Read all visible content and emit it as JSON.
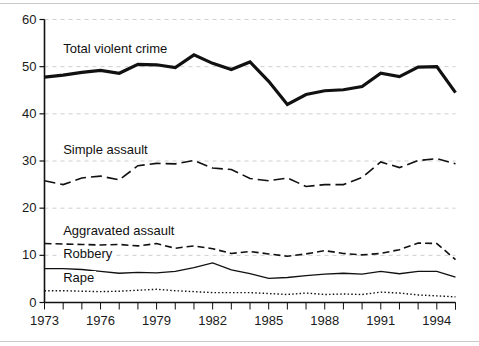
{
  "chart_data": {
    "type": "line",
    "title": "",
    "subtitle": "",
    "xlabel": "",
    "ylabel": "",
    "xlim": [
      1973,
      1995
    ],
    "ylim": [
      0,
      60
    ],
    "grid": true,
    "legend_position": "inline-labels",
    "x": [
      1973,
      1974,
      1975,
      1976,
      1977,
      1978,
      1979,
      1980,
      1981,
      1982,
      1983,
      1984,
      1985,
      1986,
      1987,
      1988,
      1989,
      1990,
      1991,
      1992,
      1993,
      1994,
      1995
    ],
    "xticks": [
      1973,
      1976,
      1979,
      1982,
      1985,
      1988,
      1991,
      1994
    ],
    "xtick_labels": [
      "1973",
      "1976",
      "1979",
      "1982",
      "1985",
      "1988",
      "1991",
      "1994"
    ],
    "yticks": [
      0,
      10,
      20,
      30,
      40,
      50,
      60
    ],
    "ytick_labels": [
      "0",
      "10",
      "20",
      "30",
      "40",
      "50",
      "60"
    ],
    "series": [
      {
        "name": "Total violent crime",
        "style": "solid-thick",
        "color": "#111111",
        "label_x": 1974.0,
        "label_y": 53.8,
        "values": [
          47.8,
          48.2,
          48.8,
          49.2,
          48.6,
          50.5,
          50.4,
          49.8,
          52.5,
          50.7,
          49.4,
          51.0,
          46.9,
          42.0,
          44.1,
          44.9,
          45.1,
          45.8,
          48.6,
          47.9,
          49.9,
          50.0,
          44.5
        ]
      },
      {
        "name": "Simple assault",
        "style": "dash-long",
        "color": "#111111",
        "label_x": 1974.0,
        "label_y": 32.3,
        "values": [
          25.8,
          25.0,
          26.4,
          26.8,
          26.0,
          29.0,
          29.5,
          29.4,
          30.1,
          28.5,
          28.2,
          26.3,
          25.8,
          26.4,
          24.6,
          25.0,
          25.0,
          26.5,
          29.8,
          28.6,
          30.1,
          30.5,
          29.4
        ]
      },
      {
        "name": "Aggravated assault",
        "style": "dash-medium",
        "color": "#111111",
        "label_x": 1974.0,
        "label_y": 15.1,
        "values": [
          12.5,
          12.4,
          12.3,
          12.2,
          12.3,
          12.0,
          12.5,
          11.5,
          12.0,
          11.4,
          10.4,
          10.8,
          10.3,
          9.8,
          10.3,
          11.0,
          10.4,
          10.1,
          10.4,
          11.2,
          12.6,
          12.5,
          9.1
        ]
      },
      {
        "name": "Robbery",
        "style": "solid-thin",
        "color": "#111111",
        "label_x": 1974.0,
        "label_y": 10.3,
        "values": [
          7.2,
          7.2,
          7.0,
          6.6,
          6.2,
          6.4,
          6.3,
          6.6,
          7.4,
          8.4,
          6.9,
          6.1,
          5.1,
          5.3,
          5.7,
          6.0,
          6.2,
          6.0,
          6.6,
          6.1,
          6.6,
          6.6,
          5.4
        ]
      },
      {
        "name": "Rape",
        "style": "dotted",
        "color": "#111111",
        "label_x": 1974.0,
        "label_y": 5.2,
        "values": [
          2.5,
          2.5,
          2.4,
          2.3,
          2.4,
          2.6,
          2.8,
          2.5,
          2.3,
          2.1,
          2.1,
          2.1,
          1.9,
          1.7,
          2.0,
          1.7,
          1.8,
          1.7,
          2.2,
          2.0,
          1.6,
          1.4,
          1.2
        ]
      }
    ]
  }
}
